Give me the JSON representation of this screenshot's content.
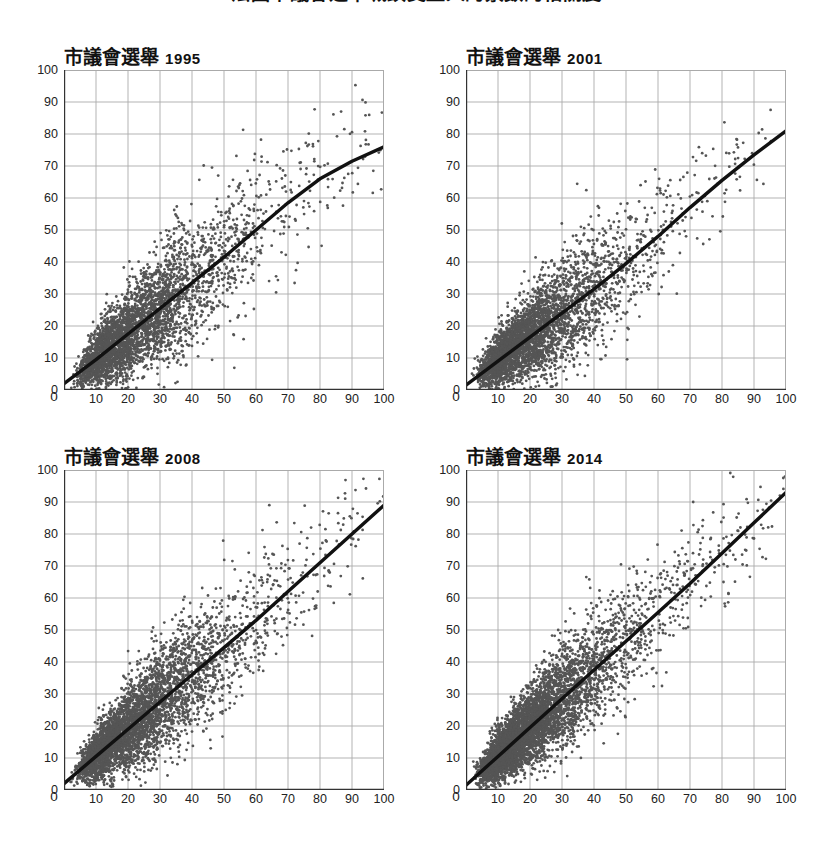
{
  "figure": {
    "main_title": "法國市議會選舉城鎮受益人的票數的相關度",
    "background_color": "#ffffff",
    "point_color": "#555555",
    "fit_line_color": "#111111",
    "grid_color": "#aaaaaa",
    "axis_color": "#333333"
  },
  "axes": {
    "x_ticks": [
      "0",
      "10",
      "20",
      "30",
      "40",
      "50",
      "60",
      "70",
      "80",
      "90",
      "100"
    ],
    "y_ticks": [
      "0",
      "10",
      "20",
      "30",
      "40",
      "50",
      "60",
      "70",
      "80",
      "90",
      "100"
    ],
    "x_label": "",
    "y_label": ""
  },
  "panels": [
    {
      "title_cjk": "市議會選舉",
      "year": "1995"
    },
    {
      "title_cjk": "市議會選舉",
      "year": "2001"
    },
    {
      "title_cjk": "市議會選舉",
      "year": "2008"
    },
    {
      "title_cjk": "市議會選舉",
      "year": "2014"
    }
  ],
  "chart_data": {
    "type": "scatter",
    "title": "法國市議會選舉城鎮受益人的票數的相關度",
    "xlabel": "",
    "ylabel": "",
    "xlim": [
      0,
      100
    ],
    "ylim": [
      0,
      100
    ],
    "xticks": [
      0,
      10,
      20,
      30,
      40,
      50,
      60,
      70,
      80,
      90,
      100
    ],
    "yticks": [
      0,
      10,
      20,
      30,
      40,
      50,
      60,
      70,
      80,
      90,
      100
    ],
    "grid": true,
    "legend": "none",
    "panel_layout": "2x2",
    "panels": [
      {
        "name": "市議會選舉 1995",
        "year": 1995,
        "n_points": 3600,
        "point_color": "#555555",
        "point_size": 1.4,
        "cloud": {
          "x_mode": 22,
          "x_spread": 15,
          "y_at_x_mode": 26,
          "slope": 0.95,
          "residual_sd": 10.5,
          "skew": "right-tailed in x"
        },
        "fit_line": {
          "kind": "loess",
          "x": [
            0,
            10,
            20,
            30,
            40,
            50,
            60,
            70,
            80,
            90,
            100
          ],
          "y": [
            2,
            9.5,
            17.5,
            25.5,
            33.5,
            41.5,
            50,
            58.5,
            66,
            71.5,
            76
          ]
        }
      },
      {
        "name": "市議會選舉 2001",
        "year": 2001,
        "n_points": 3600,
        "point_color": "#555555",
        "point_size": 1.4,
        "cloud": {
          "x_mode": 20,
          "x_spread": 14,
          "y_at_x_mode": 22,
          "slope": 0.9,
          "residual_sd": 10,
          "skew": "right-tailed in x"
        },
        "fit_line": {
          "kind": "loess",
          "x": [
            0,
            10,
            20,
            30,
            40,
            50,
            60,
            70,
            80,
            90,
            100
          ],
          "y": [
            1.5,
            9,
            16.5,
            24,
            31.5,
            39.5,
            48,
            57,
            65.5,
            73.5,
            81
          ]
        }
      },
      {
        "name": "市議會選舉 2008",
        "year": 2008,
        "n_points": 4200,
        "point_color": "#555555",
        "point_size": 1.4,
        "cloud": {
          "x_mode": 22,
          "x_spread": 14,
          "y_at_x_mode": 23,
          "slope": 0.88,
          "residual_sd": 9.5,
          "skew": "right-tailed in x"
        },
        "fit_line": {
          "kind": "loess",
          "x": [
            0,
            10,
            20,
            30,
            40,
            50,
            60,
            70,
            80,
            90,
            100
          ],
          "y": [
            2,
            10.5,
            19,
            27.5,
            36,
            44.5,
            53,
            62,
            71,
            80,
            89
          ]
        }
      },
      {
        "name": "市議會選舉 2014",
        "year": 2014,
        "n_points": 5200,
        "point_color": "#555555",
        "point_size": 1.4,
        "cloud": {
          "x_mode": 20,
          "x_spread": 13,
          "y_at_x_mode": 20,
          "slope": 0.93,
          "residual_sd": 9,
          "skew": "right-tailed in x"
        },
        "fit_line": {
          "kind": "loess",
          "x": [
            0,
            10,
            20,
            30,
            40,
            50,
            60,
            70,
            80,
            90,
            100
          ],
          "y": [
            1.5,
            10.5,
            19.5,
            28.5,
            37.5,
            46.5,
            55.5,
            64.5,
            74,
            83.5,
            93
          ]
        }
      }
    ]
  }
}
